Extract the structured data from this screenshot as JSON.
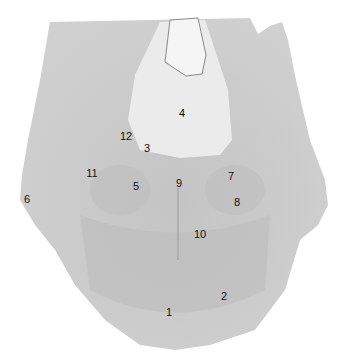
{
  "image": {
    "description": "Grayscale cross-section specimen with numbered anatomical labels",
    "background": "#ffffff",
    "tissue_color": "#c9c9c9",
    "light_region_color": "#ececec"
  },
  "labels": [
    {
      "text": "4",
      "x": 182,
      "y": 113
    },
    {
      "text": "12",
      "x": 126,
      "y": 136
    },
    {
      "text": "3",
      "x": 147,
      "y": 148
    },
    {
      "text": "11",
      "x": 92,
      "y": 173
    },
    {
      "text": "7",
      "x": 231,
      "y": 176
    },
    {
      "text": "9",
      "x": 179,
      "y": 183
    },
    {
      "text": "5",
      "x": 136,
      "y": 186
    },
    {
      "text": "6",
      "x": 27,
      "y": 199
    },
    {
      "text": "8",
      "x": 237,
      "y": 202
    },
    {
      "text": "10",
      "x": 200,
      "y": 234
    },
    {
      "text": "2",
      "x": 224,
      "y": 296
    },
    {
      "text": "1",
      "x": 169,
      "y": 312
    }
  ]
}
